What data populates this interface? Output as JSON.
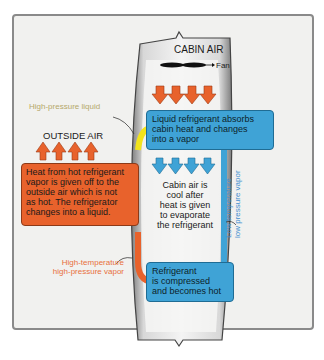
{
  "diagram": {
    "cabin_air_label": "CABIN AIR",
    "fan_label": "Fan",
    "outside_air_label": "OUTSIDE AIR",
    "high_pressure_liquid_label": "High-pressure liquid",
    "high_temp_vapor_label_line1": "High-temperature",
    "high_temp_vapor_label_line2": "high-pressure vapor",
    "low_temp_vapor_label_line1": "Low temperature",
    "low_temp_vapor_label_line2": "low pressure vapor",
    "condenser_box": {
      "line1": "Heat from hot refrigerant",
      "line2": "vapor is given off to the",
      "line3": "outside air which is not",
      "line4": "as hot. The refrigerator",
      "line5": "changes into a liquid."
    },
    "evaporator_box": {
      "line1": "Liquid refrigerant absorbs",
      "line2": "cabin heat and changes",
      "line3": "into a vapor"
    },
    "cabin_cool_text": {
      "line1": "Cabin air is",
      "line2": "cool after",
      "line3": "heat is given",
      "line4": "to evaporate",
      "line5": "the refrigerant"
    },
    "compressor_box": {
      "line1": "Refrigerant",
      "line2": "is compressed",
      "line3": "and becomes hot"
    },
    "colors": {
      "hot": "#e8622c",
      "cold": "#3fa3d6",
      "liquid": "#f2e41c",
      "high_pressure_liquid_text": "#b5a86a",
      "high_temp_text": "#e8703c",
      "low_temp_text": "#3f8fd0"
    }
  }
}
